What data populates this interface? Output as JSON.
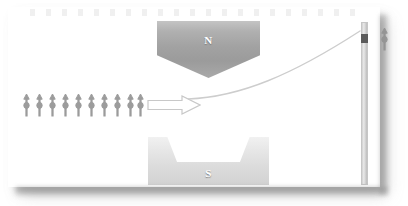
{
  "figure": {
    "background_color": "#ffffff",
    "panel_color": "#ffffff"
  },
  "magnets": [
    {
      "id": "north",
      "pole_label": "N",
      "shape": "pentagon-pointing-down",
      "fill_color": "#a2a2a2",
      "label_color": "#ffffff"
    },
    {
      "id": "south",
      "pole_label": "S",
      "shape": "trough-notched-rectangle",
      "fill_color": "#dcdcdc",
      "label_color": "#ffffff"
    }
  ],
  "source_beam": {
    "spin_symbol_name": "spin-up-arrow",
    "spin_count": 10,
    "spin_color": "#9c9c9c",
    "arrow_label": "beam-direction",
    "arrow_outline_color": "#c8c8c8"
  },
  "deflected_beam": {
    "path_name": "deflected-beam-trajectory",
    "stroke_color": "#cdcdcd",
    "direction": "upward"
  },
  "detector": {
    "screen_name": "detector-screen",
    "screen_color": "#d8d8d8",
    "spot_count": 1,
    "spot_color": "#5a5a5a",
    "spot_position": "upper",
    "result_spin_symbol": "spin-up-arrow"
  }
}
